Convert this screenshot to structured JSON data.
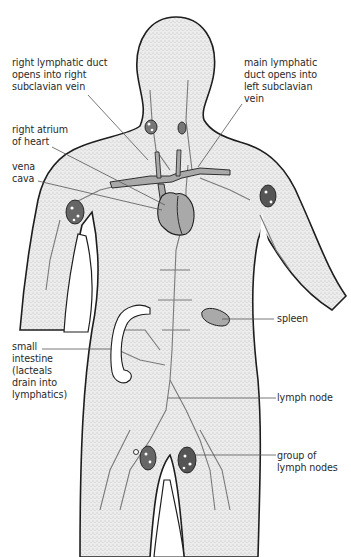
{
  "figure": {
    "colors": {
      "body_fill": "#e9e9e9",
      "outline": "#1e1e1e",
      "organ_fill": "#a9a9a9",
      "vessel": "#7a7a7a",
      "leader": "#555555",
      "text": "#2a2a2a"
    }
  },
  "labels": {
    "right_lymphatic_duct": "right lymphatic duct\nopens into right\nsubclavian vein",
    "main_lymphatic_duct": "main lymphatic\nduct opens into\nleft subclavian\nvein",
    "right_atrium": "right atrium\nof heart",
    "vena_cava": "vena\ncava",
    "small_intestine": "small\nintestine\n(lacteals\ndrain into\nlymphatics)",
    "spleen": "spleen",
    "lymph_node": "lymph node",
    "group_of_lymph_nodes": "group of\nlymph nodes"
  }
}
